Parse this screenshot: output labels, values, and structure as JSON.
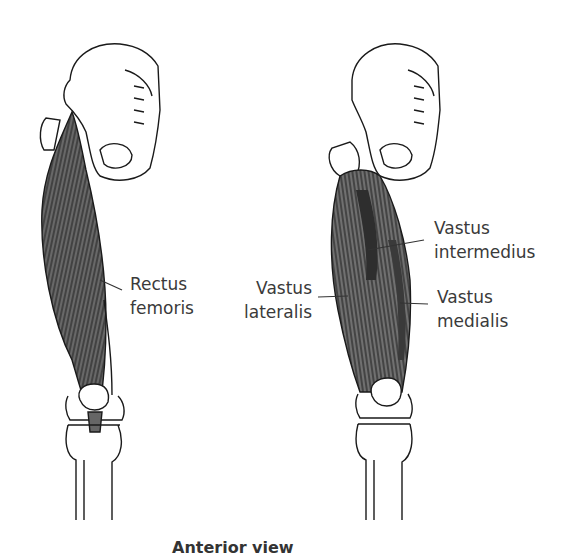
{
  "figure": {
    "caption": "Anterior view",
    "left_panel": {
      "labels": [
        {
          "line1": "Rectus",
          "line2": "femoris"
        }
      ]
    },
    "right_panel": {
      "labels": [
        {
          "line1": "Vastus",
          "line2": "intermedius"
        },
        {
          "line1": "Vastus",
          "line2": "lateralis"
        },
        {
          "line1": "Vastus",
          "line2": "medialis"
        }
      ]
    },
    "colors": {
      "muscle": "#4a4a4a",
      "muscle_light": "#8a8a8a",
      "bone_outline": "#1a1a1a",
      "text": "#3a3a3a"
    }
  }
}
